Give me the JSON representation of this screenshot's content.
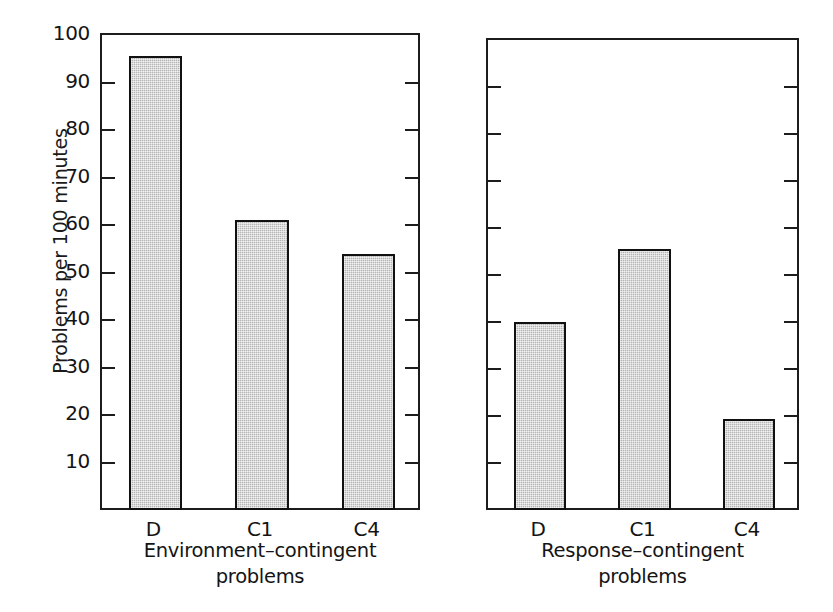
{
  "chart_data": {
    "type": "bar",
    "title": "",
    "subtitle": "",
    "xlabel": "",
    "ylabel": "Problems per 100 minutes",
    "ylim": [
      0,
      100
    ],
    "ytick_labels": [
      "100",
      "90",
      "80",
      "70",
      "60",
      "50",
      "40",
      "30",
      "20",
      "10"
    ],
    "yticks": [
      100,
      90,
      80,
      70,
      60,
      50,
      40,
      30,
      20,
      10
    ],
    "grid": false,
    "legend": false,
    "categories": [
      "D",
      "C1",
      "C4"
    ],
    "panels": [
      {
        "id": "environment-contingent",
        "caption_line1": "Environment–contingent",
        "caption_line2": "problems",
        "categories": [
          "D",
          "C1",
          "C4"
        ],
        "values": [
          95.5,
          61,
          54
        ]
      },
      {
        "id": "response-contingent",
        "caption_line1": "Response–contingent",
        "caption_line2": "problems",
        "categories": [
          "D",
          "C1",
          "C4"
        ],
        "values": [
          40,
          55.5,
          19.3
        ]
      }
    ],
    "series": [
      {
        "name": "Environment-contingent problems",
        "values": [
          95.5,
          61,
          54
        ]
      },
      {
        "name": "Response-contingent problems",
        "values": [
          40,
          55.5,
          19.3
        ]
      }
    ],
    "colors": {
      "bar_fill": "#b5b5b5",
      "bar_edge": "#111111",
      "axis": "#1c1c1c",
      "text": "#141414",
      "background": "#ffffff"
    }
  }
}
